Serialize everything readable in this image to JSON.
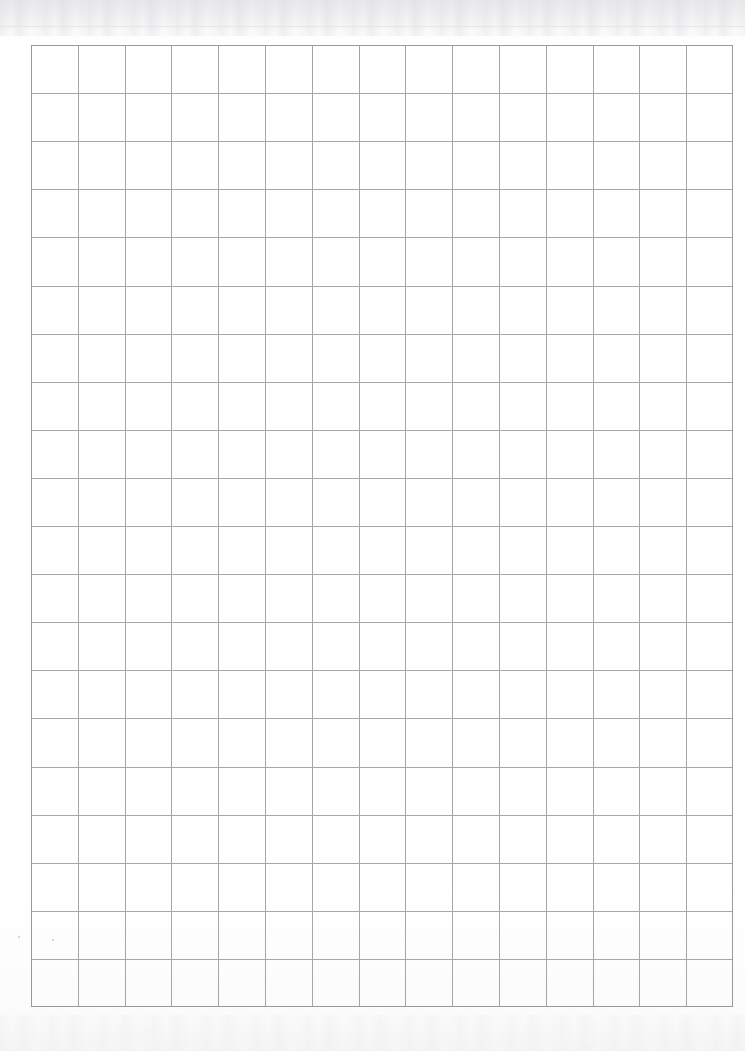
{
  "document": {
    "type": "scanned-grid-paper",
    "orientation": "portrait",
    "page_width_px": 745,
    "page_height_px": 1051,
    "paper_color": "#ffffff",
    "background_color": "#fefefe"
  },
  "grid": {
    "name": "ruled-square-grid",
    "columns": 15,
    "rows": 20,
    "left_px": 31,
    "top_px": 45,
    "right_px": 733,
    "bottom_px": 1007,
    "width_px": 702,
    "height_px": 962,
    "cell_width_px": 46.8,
    "cell_height_px": 48.1,
    "line_color": "#a6a6aa",
    "border_color": "#97979c",
    "line_width_px": 1
  },
  "margins": {
    "left_px": 31,
    "top_px": 45,
    "right_px": 12,
    "bottom_px": 44
  },
  "artifacts": {
    "top_band_color": "#e6e6ea",
    "bottom_band_color": "#f2f2f4",
    "hairline_y_px": 26,
    "specks": [
      {
        "x_px": 18,
        "y_px": 936
      },
      {
        "x_px": 52,
        "y_px": 939
      }
    ]
  },
  "content": {
    "text": "",
    "marks": [],
    "note": "Blank grid paper — no written content"
  }
}
